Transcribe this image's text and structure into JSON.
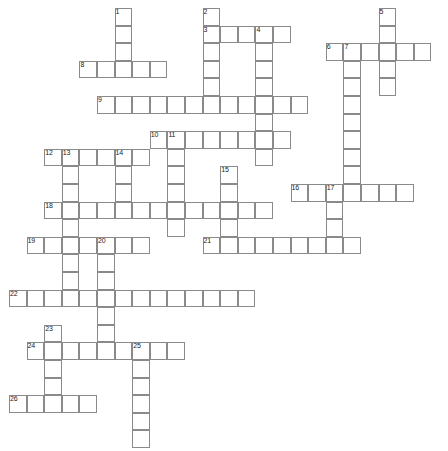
{
  "puzzle": {
    "title": "Crossword Grid",
    "cell_size": 17.6,
    "origin_x": 9,
    "origin_y": 8,
    "colors": {
      "cell_border": "#8a8a8a",
      "cell_fill": "#ffffff",
      "number_text": "#1a1a1a",
      "page_background": "#ffffff"
    },
    "entries": [
      {
        "number": "1",
        "direction": "down",
        "col": 6,
        "row": 0,
        "length": 4
      },
      {
        "number": "2",
        "direction": "down",
        "col": 11,
        "row": 0,
        "length": 5
      },
      {
        "number": "3",
        "direction": "across",
        "col": 11,
        "row": 1,
        "length": 5
      },
      {
        "number": "4",
        "direction": "down",
        "col": 14,
        "row": 1,
        "length": 8
      },
      {
        "number": "5",
        "direction": "down",
        "col": 21,
        "row": 0,
        "length": 5
      },
      {
        "number": "6",
        "direction": "across",
        "col": 18,
        "row": 2,
        "length": 6
      },
      {
        "number": "7",
        "direction": "down",
        "col": 19,
        "row": 2,
        "length": 9
      },
      {
        "number": "8",
        "direction": "across",
        "col": 4,
        "row": 3,
        "length": 5
      },
      {
        "number": "9",
        "direction": "across",
        "col": 5,
        "row": 5,
        "length": 12
      },
      {
        "number": "10",
        "direction": "across",
        "col": 8,
        "row": 7,
        "length": 8
      },
      {
        "number": "11",
        "direction": "down",
        "col": 9,
        "row": 7,
        "length": 6
      },
      {
        "number": "12",
        "direction": "across",
        "col": 2,
        "row": 8,
        "length": 6
      },
      {
        "number": "13",
        "direction": "down",
        "col": 3,
        "row": 8,
        "length": 8
      },
      {
        "number": "14",
        "direction": "down",
        "col": 6,
        "row": 8,
        "length": 3
      },
      {
        "number": "15",
        "direction": "down",
        "col": 12,
        "row": 9,
        "length": 5
      },
      {
        "number": "16",
        "direction": "across",
        "col": 16,
        "row": 10,
        "length": 7
      },
      {
        "number": "17",
        "direction": "down",
        "col": 18,
        "row": 10,
        "length": 3
      },
      {
        "number": "18",
        "direction": "across",
        "col": 2,
        "row": 11,
        "length": 13
      },
      {
        "number": "19",
        "direction": "across",
        "col": 1,
        "row": 13,
        "length": 7
      },
      {
        "number": "20",
        "direction": "down",
        "col": 5,
        "row": 13,
        "length": 7
      },
      {
        "number": "21",
        "direction": "across",
        "col": 11,
        "row": 13,
        "length": 9
      },
      {
        "number": "22",
        "direction": "across",
        "col": 0,
        "row": 16,
        "length": 14
      },
      {
        "number": "23",
        "direction": "down",
        "col": 2,
        "row": 18,
        "length": 5
      },
      {
        "number": "24",
        "direction": "across",
        "col": 1,
        "row": 19,
        "length": 9
      },
      {
        "number": "25",
        "direction": "down",
        "col": 7,
        "row": 19,
        "length": 6
      },
      {
        "number": "26",
        "direction": "across",
        "col": 0,
        "row": 22,
        "length": 5
      }
    ]
  }
}
